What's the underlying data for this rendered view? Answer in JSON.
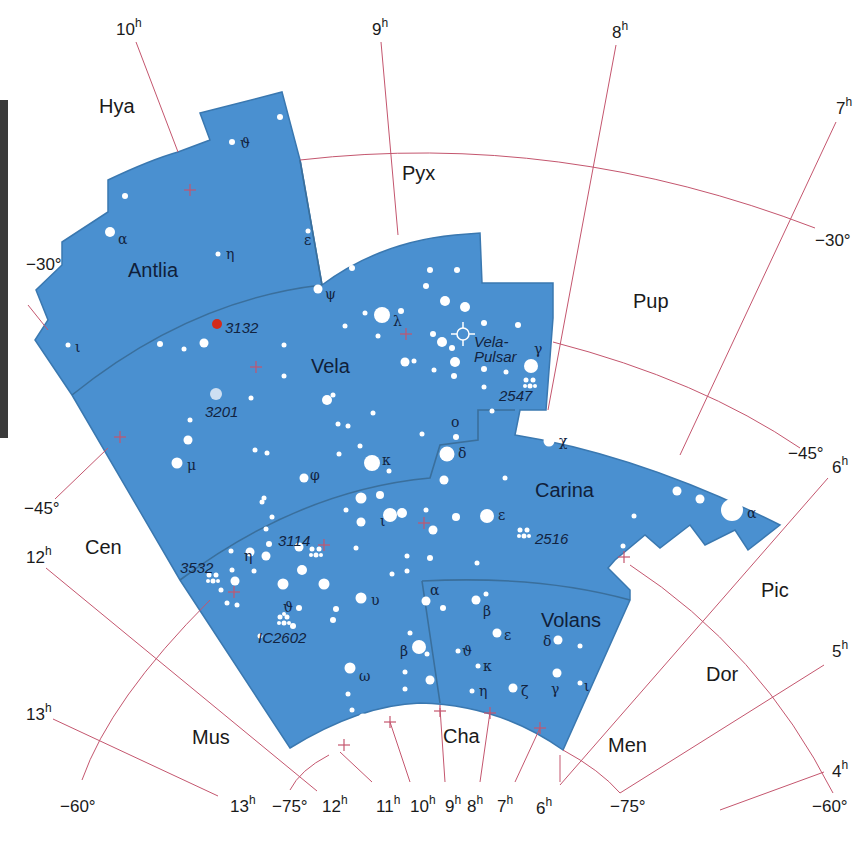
{
  "map": {
    "title": "Antlia, Vela, Carina, Volans star chart",
    "colors": {
      "region": "#4a90d0",
      "grid": "#c4566e",
      "star": "#ffffff",
      "highlight": "#d42a1a"
    },
    "highlighted_constellations": [
      {
        "name": "Antlia",
        "label_pos": [
          158,
          270
        ]
      },
      {
        "name": "Vela",
        "label_pos": [
          333,
          366
        ]
      },
      {
        "name": "Carina",
        "label_pos": [
          570,
          490
        ]
      },
      {
        "name": "Volans",
        "label_pos": [
          576,
          620
        ]
      }
    ],
    "neighbor_constellations": [
      {
        "name": "Hya",
        "pos": [
          120,
          113
        ]
      },
      {
        "name": "Pyx",
        "pos": [
          422,
          178
        ]
      },
      {
        "name": "Pup",
        "pos": [
          654,
          307
        ]
      },
      {
        "name": "Cen",
        "pos": [
          106,
          552
        ]
      },
      {
        "name": "Pic",
        "pos": [
          776,
          594
        ]
      },
      {
        "name": "Dor",
        "pos": [
          724,
          680
        ]
      },
      {
        "name": "Mus",
        "pos": [
          214,
          743
        ]
      },
      {
        "name": "Cha",
        "pos": [
          464,
          741
        ]
      },
      {
        "name": "Men",
        "pos": [
          630,
          752
        ]
      }
    ],
    "ra_labels": [
      {
        "value": "10",
        "unit": "h",
        "pos": [
          118,
          31
        ]
      },
      {
        "value": "9",
        "unit": "h",
        "pos": [
          372,
          31
        ]
      },
      {
        "value": "8",
        "unit": "h",
        "pos": [
          612,
          35
        ]
      },
      {
        "value": "7",
        "unit": "h",
        "pos": [
          834,
          112
        ]
      },
      {
        "value": "6",
        "unit": "h",
        "pos": [
          836,
          470
        ]
      },
      {
        "value": "5",
        "unit": "h",
        "pos": [
          834,
          655
        ]
      },
      {
        "value": "4",
        "unit": "h",
        "pos": [
          834,
          775
        ]
      },
      {
        "value": "12",
        "unit": "h",
        "pos": [
          26,
          560
        ]
      },
      {
        "value": "13",
        "unit": "h",
        "pos": [
          26,
          718
        ]
      },
      {
        "value": "13",
        "unit": "h",
        "pos": [
          230,
          810
        ]
      },
      {
        "value": "12",
        "unit": "h",
        "pos": [
          322,
          810
        ]
      },
      {
        "value": "11",
        "unit": "h",
        "pos": [
          376,
          810
        ]
      },
      {
        "value": "10",
        "unit": "h",
        "pos": [
          412,
          810
        ]
      },
      {
        "value": "9",
        "unit": "h",
        "pos": [
          444,
          810
        ]
      },
      {
        "value": "8",
        "unit": "h",
        "pos": [
          468,
          810
        ]
      },
      {
        "value": "7",
        "unit": "h",
        "pos": [
          498,
          810
        ]
      },
      {
        "value": "6",
        "unit": "h",
        "pos": [
          536,
          812
        ]
      }
    ],
    "dec_labels": [
      {
        "value": "−30°",
        "pos": [
          24,
          268
        ]
      },
      {
        "value": "−30°",
        "pos": [
          815,
          243
        ]
      },
      {
        "value": "−45°",
        "pos": [
          24,
          512
        ]
      },
      {
        "value": "−45°",
        "pos": [
          788,
          457
        ]
      },
      {
        "value": "−60°",
        "pos": [
          60,
          810
        ]
      },
      {
        "value": "−60°",
        "pos": [
          812,
          810
        ]
      },
      {
        "value": "−75°",
        "pos": [
          272,
          810
        ]
      },
      {
        "value": "−75°",
        "pos": [
          610,
          810
        ]
      }
    ],
    "star_labels": [
      {
        "text": "ϑ",
        "pos": [
          242,
          148
        ]
      },
      {
        "text": "α",
        "pos": [
          120,
          243
        ]
      },
      {
        "text": "η",
        "pos": [
          228,
          258
        ]
      },
      {
        "text": "ε",
        "pos": [
          305,
          245
        ]
      },
      {
        "text": "ψ",
        "pos": [
          326,
          298
        ]
      },
      {
        "text": "ι",
        "pos": [
          76,
          352
        ]
      },
      {
        "text": "λ",
        "pos": [
          394,
          326
        ]
      },
      {
        "text": "γ",
        "pos": [
          534,
          353
        ]
      },
      {
        "text": "μ",
        "pos": [
          188,
          469
        ]
      },
      {
        "text": "φ",
        "pos": [
          311,
          479
        ]
      },
      {
        "text": "κ",
        "pos": [
          382,
          464
        ]
      },
      {
        "text": "ο",
        "pos": [
          452,
          425
        ]
      },
      {
        "text": "δ",
        "pos": [
          459,
          457
        ]
      },
      {
        "text": "χ",
        "pos": [
          560,
          445
        ]
      },
      {
        "text": "ε",
        "pos": [
          499,
          520
        ]
      },
      {
        "text": "α",
        "pos": [
          748,
          518
        ]
      },
      {
        "text": "ι",
        "pos": [
          381,
          525
        ]
      },
      {
        "text": "η",
        "pos": [
          245,
          560
        ]
      },
      {
        "text": "ϑ",
        "pos": [
          284,
          611
        ]
      },
      {
        "text": "υ",
        "pos": [
          372,
          604
        ]
      },
      {
        "text": "α",
        "pos": [
          430,
          594
        ]
      },
      {
        "text": "β",
        "pos": [
          484,
          615
        ]
      },
      {
        "text": "β",
        "pos": [
          401,
          655
        ]
      },
      {
        "text": "ε",
        "pos": [
          505,
          639
        ]
      },
      {
        "text": "δ",
        "pos": [
          545,
          645
        ]
      },
      {
        "text": "ϑ",
        "pos": [
          463,
          655
        ]
      },
      {
        "text": "κ",
        "pos": [
          484,
          670
        ]
      },
      {
        "text": "ω",
        "pos": [
          360,
          680
        ]
      },
      {
        "text": "η",
        "pos": [
          480,
          695
        ]
      },
      {
        "text": "ζ",
        "pos": [
          522,
          695
        ]
      },
      {
        "text": "γ",
        "pos": [
          552,
          693
        ]
      },
      {
        "text": "ι",
        "pos": [
          584,
          690
        ]
      }
    ],
    "deep_sky_labels": [
      {
        "text": "3132",
        "pos": [
          226,
          332
        ]
      },
      {
        "text": "3201",
        "pos": [
          205,
          416
        ]
      },
      {
        "text": "Vela-",
        "pos": [
          474,
          346
        ]
      },
      {
        "text": "Pulsar",
        "pos": [
          474,
          362
        ]
      },
      {
        "text": "2547",
        "pos": [
          499,
          400
        ]
      },
      {
        "text": "3114",
        "pos": [
          278,
          545
        ]
      },
      {
        "text": "2516",
        "pos": [
          535,
          543
        ]
      },
      {
        "text": "3532",
        "pos": [
          180,
          572
        ]
      },
      {
        "text": "IC2602",
        "pos": [
          258,
          643
        ]
      }
    ]
  }
}
